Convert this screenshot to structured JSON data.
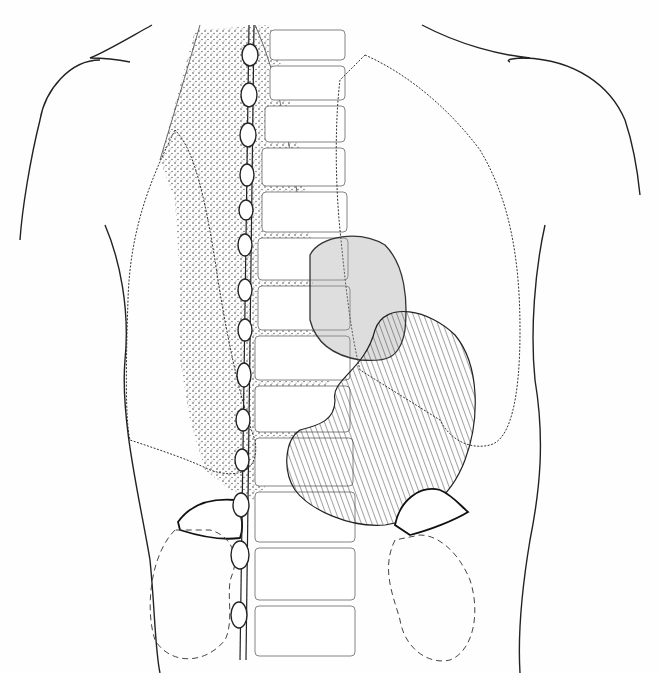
{
  "figure": {
    "structures": [
      {
        "name": "body-outline",
        "style": "solid line"
      },
      {
        "name": "vertebral-column",
        "style": "light outline"
      },
      {
        "name": "sympathetic-chain",
        "style": "beaded solid line"
      },
      {
        "name": "stippled-nerve-plexus",
        "style": "dotted stipple"
      },
      {
        "name": "left-lung",
        "style": "scalloped line"
      },
      {
        "name": "right-lung",
        "style": "scalloped line"
      },
      {
        "name": "heart",
        "style": "grey shaded"
      },
      {
        "name": "stomach",
        "style": "line hatched"
      },
      {
        "name": "adrenal-glands",
        "style": "bold outline"
      },
      {
        "name": "kidneys",
        "style": "dashed outline"
      }
    ],
    "colors": {
      "line": "#222222",
      "heart_fill": "#cfcfcf",
      "background": "#fefefe"
    }
  }
}
